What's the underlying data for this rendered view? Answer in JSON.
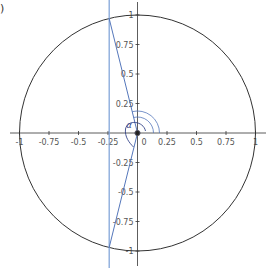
{
  "corner_label": ")",
  "plot": {
    "center": {
      "x": 137.5,
      "y": 133
    },
    "scale": 118,
    "x_ticks": [
      {
        "v": -1,
        "label": "-1"
      },
      {
        "v": -0.75,
        "label": "-0.75"
      },
      {
        "v": -0.5,
        "label": "-0.5"
      },
      {
        "v": -0.25,
        "label": "-0.25"
      },
      {
        "v": 0,
        "label": "0"
      },
      {
        "v": 0.25,
        "label": "0.25"
      },
      {
        "v": 0.5,
        "label": "0.5"
      },
      {
        "v": 0.75,
        "label": "0.75"
      },
      {
        "v": 1,
        "label": "1"
      }
    ],
    "y_ticks": [
      {
        "v": 1,
        "label": "1"
      },
      {
        "v": 0.75,
        "label": "0.75"
      },
      {
        "v": 0.5,
        "label": "0.5"
      },
      {
        "v": 0.25,
        "label": "0.25"
      },
      {
        "v": -0.25,
        "label": "-0.25"
      },
      {
        "v": -0.5,
        "label": "-0.5"
      },
      {
        "v": -0.75,
        "label": "-0.75"
      },
      {
        "v": -1,
        "label": "-1"
      }
    ],
    "unit_circle": {
      "radius": 1,
      "color": "#333333"
    },
    "vertical_line": {
      "x": -0.24,
      "color": "#7a9fd6"
    },
    "segments": [
      {
        "from": [
          -0.24,
          0.97
        ],
        "to": [
          0,
          0
        ],
        "color": "#5577bb"
      },
      {
        "from": [
          0,
          0
        ],
        "to": [
          -0.24,
          -0.97
        ],
        "color": "#5577bb"
      }
    ],
    "angle_label": "α",
    "colors": {
      "axis": "#333333",
      "blue": "#5577bb",
      "light_blue": "#7a9fd6"
    }
  }
}
